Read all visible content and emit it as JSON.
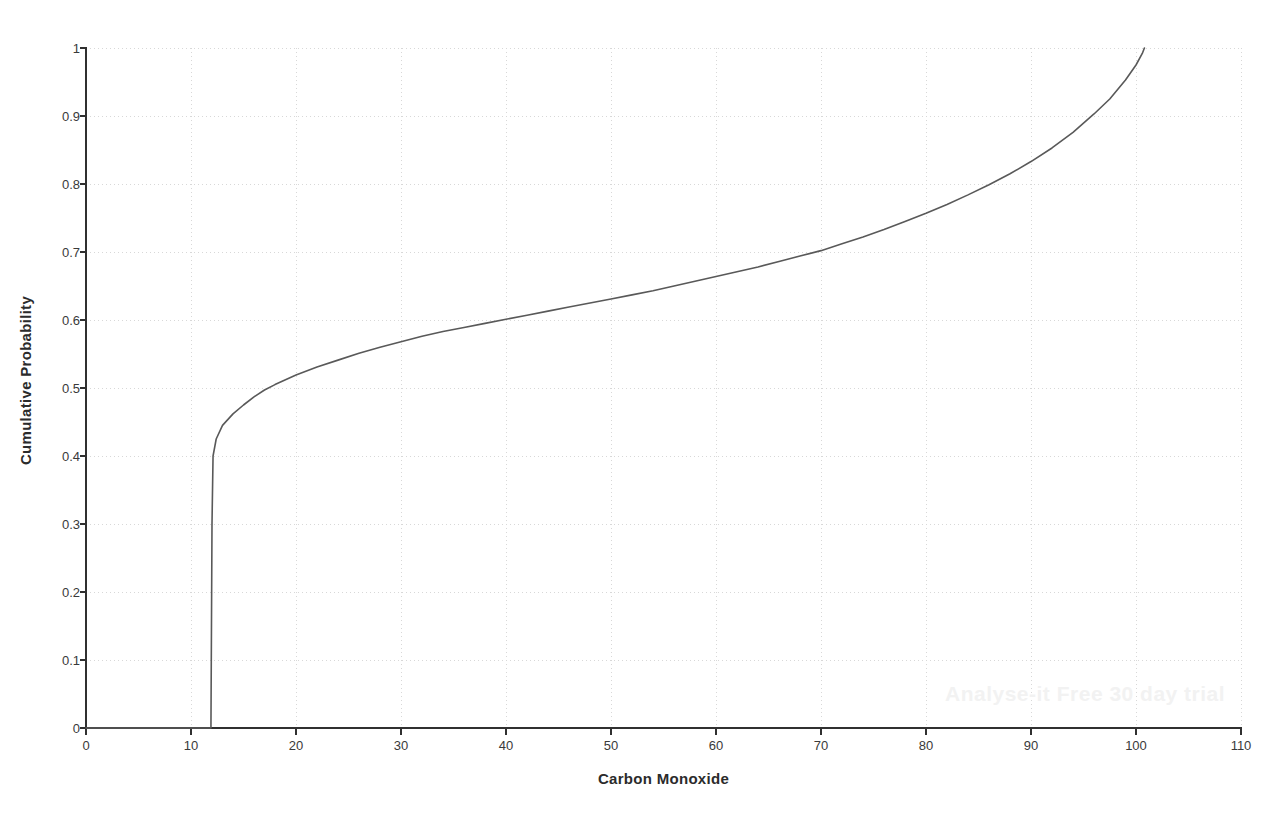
{
  "chart_data": {
    "type": "line",
    "title": "",
    "subtitle": "",
    "xlabel": "Carbon Monoxide",
    "ylabel": "Cumulative Probability",
    "xlim": [
      0,
      110
    ],
    "ylim": [
      0,
      1
    ],
    "xticks": [
      0,
      10,
      20,
      30,
      40,
      50,
      60,
      70,
      80,
      90,
      100,
      110
    ],
    "xtick_labels": [
      "0",
      "10",
      "20",
      "30",
      "40",
      "50",
      "60",
      "70",
      "80",
      "90",
      "100",
      "110"
    ],
    "yticks": [
      0,
      0.1,
      0.2,
      0.3,
      0.4,
      0.5,
      0.6,
      0.7,
      0.8,
      0.9,
      1
    ],
    "ytick_labels": [
      "0",
      "0.1",
      "0.2",
      "0.3",
      "0.4",
      "0.5",
      "0.6",
      "0.7",
      "0.8",
      "0.9",
      "1"
    ],
    "grid": true,
    "grid_style": "dotted",
    "grid_color": "#d8d8d8",
    "legend": null,
    "legend_position": "none",
    "line_color": "#595959",
    "line_width": 1.6,
    "series": [
      {
        "name": "Cumulative Probability of Carbon Monoxide",
        "points": [
          [
            0.0,
            0.0
          ],
          [
            6.0,
            0.0
          ],
          [
            11.0,
            0.0
          ],
          [
            11.9,
            0.0
          ],
          [
            12.0,
            0.3
          ],
          [
            12.1,
            0.4
          ],
          [
            12.4,
            0.425
          ],
          [
            13.0,
            0.445
          ],
          [
            14.0,
            0.462
          ],
          [
            15.0,
            0.475
          ],
          [
            16.0,
            0.487
          ],
          [
            17.0,
            0.497
          ],
          [
            18.0,
            0.505
          ],
          [
            19.0,
            0.512
          ],
          [
            20.0,
            0.519
          ],
          [
            22.0,
            0.531
          ],
          [
            24.0,
            0.541
          ],
          [
            26.0,
            0.551
          ],
          [
            28.0,
            0.56
          ],
          [
            30.0,
            0.568
          ],
          [
            32.0,
            0.576
          ],
          [
            34.0,
            0.583
          ],
          [
            36.0,
            0.589
          ],
          [
            38.0,
            0.595
          ],
          [
            40.0,
            0.601
          ],
          [
            42.0,
            0.607
          ],
          [
            44.0,
            0.613
          ],
          [
            46.0,
            0.619
          ],
          [
            48.0,
            0.625
          ],
          [
            50.0,
            0.631
          ],
          [
            52.0,
            0.637
          ],
          [
            54.0,
            0.643
          ],
          [
            56.0,
            0.65
          ],
          [
            58.0,
            0.657
          ],
          [
            60.0,
            0.664
          ],
          [
            62.0,
            0.671
          ],
          [
            64.0,
            0.678
          ],
          [
            66.0,
            0.686
          ],
          [
            68.0,
            0.694
          ],
          [
            70.0,
            0.702
          ],
          [
            72.0,
            0.712
          ],
          [
            74.0,
            0.722
          ],
          [
            76.0,
            0.733
          ],
          [
            78.0,
            0.745
          ],
          [
            80.0,
            0.757
          ],
          [
            82.0,
            0.77
          ],
          [
            84.0,
            0.784
          ],
          [
            86.0,
            0.799
          ],
          [
            88.0,
            0.815
          ],
          [
            90.0,
            0.833
          ],
          [
            92.0,
            0.853
          ],
          [
            94.0,
            0.876
          ],
          [
            96.0,
            0.903
          ],
          [
            97.5,
            0.925
          ],
          [
            99.0,
            0.953
          ],
          [
            100.0,
            0.975
          ],
          [
            100.6,
            0.992
          ],
          [
            100.8,
            1.0
          ]
        ]
      }
    ],
    "baseline": {
      "name": "zero-baseline",
      "y": 0,
      "x_start": 0,
      "x_end": 110
    }
  },
  "axes": {
    "y_axis_title": "Cumulative Probability",
    "x_axis_title": "Carbon Monoxide"
  },
  "watermark": {
    "text": "Analyse-it Free 30 day trial"
  },
  "colors": {
    "background": "#ffffff",
    "axis": "#303030",
    "grid": "#d8d8d8",
    "curve": "#595959",
    "text": "#2b2b2b",
    "watermark": "#f2f2f2"
  }
}
